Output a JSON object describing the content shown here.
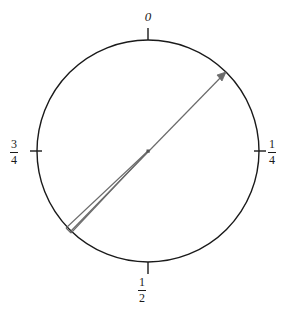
{
  "figure": {
    "kind": "phase-circle-diagram",
    "background_color": "#ffffff",
    "circle": {
      "center_x": 148,
      "center_y": 151,
      "radius": 111,
      "stroke_color": "#1a1a1a",
      "stroke_width": 1.4
    },
    "center_dot": {
      "x": 148,
      "y": 151,
      "size": 3,
      "color": "#555555"
    }
  },
  "ticks": [
    {
      "name": "tick-zero",
      "label_text": "0",
      "is_fraction": false,
      "phase_value": 0,
      "angle_degrees": 0,
      "position": "top"
    },
    {
      "name": "tick-one-quarter",
      "label_text": "1/4",
      "numerator": "1",
      "denominator": "4",
      "is_fraction": true,
      "phase_value": 0.25,
      "angle_degrees": 90,
      "position": "right"
    },
    {
      "name": "tick-one-half",
      "label_text": "1/2",
      "numerator": "1",
      "denominator": "2",
      "is_fraction": true,
      "phase_value": 0.5,
      "angle_degrees": 180,
      "position": "bottom"
    },
    {
      "name": "tick-three-quarters",
      "label_text": "3/4",
      "numerator": "3",
      "denominator": "4",
      "is_fraction": true,
      "phase_value": 0.75,
      "angle_degrees": 270,
      "position": "left"
    }
  ],
  "vector": {
    "name": "phase-arrow",
    "color": "#6b6b6b",
    "stroke_width": 1.2,
    "tip_x": 225,
    "tip_y": 73,
    "tail_x": 70,
    "tail_y": 232,
    "arrowhead_size": 5,
    "phase_value": 0.125,
    "angle_degrees": 45,
    "tail_wedge": {
      "name": "uncertainty-wedge",
      "split_x": 66,
      "split_y": 228,
      "color": "#6b6b6b"
    }
  }
}
